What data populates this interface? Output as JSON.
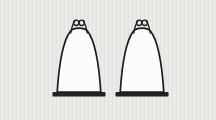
{
  "canvas": {
    "width": 216,
    "height": 120
  },
  "illustration": {
    "description": "Two identical bell-shaped mantle figures, each topped with a double wire hanging loop and standing upright on a short dark base bar, drawn in black outline on a light gray textured background",
    "figure_count": 2,
    "colors": {
      "background": "#e9e9e6",
      "outline": "#1c1c1c",
      "body_fill": "#fcfcfb",
      "base_fill": "#222222"
    },
    "figures": [
      {
        "id": "gas-mantle-left",
        "center_x": 79,
        "top_y": 29
      },
      {
        "id": "gas-mantle-right",
        "center_x": 142,
        "top_y": 29
      }
    ]
  }
}
